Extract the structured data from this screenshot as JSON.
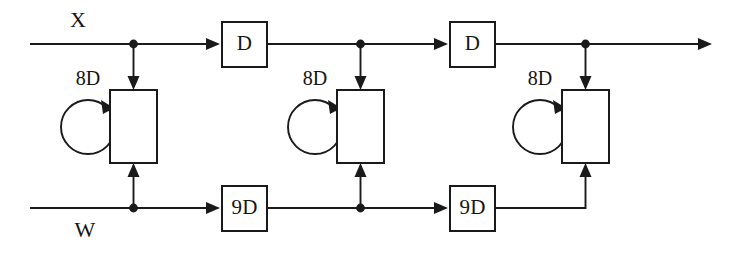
{
  "diagram": {
    "type": "signal-flow-diagram",
    "canvas": {
      "width": 730,
      "height": 254
    },
    "colors": {
      "line": "#1a1a1a",
      "background": "#ffffff",
      "text": "#141414"
    },
    "io_labels": [
      {
        "id": "input-x",
        "text": "X",
        "x": 78,
        "y": 22,
        "position": "above-top-line"
      },
      {
        "id": "input-w",
        "text": "W",
        "x": 85,
        "y": 232,
        "position": "below-bottom-line"
      }
    ],
    "top_line": {
      "y": 44,
      "x_start": 30,
      "x_end": 703,
      "terminal_arrow": true,
      "junctions": [
        {
          "id": "tap-1",
          "x": 131
        },
        {
          "id": "tap-2",
          "x": 358
        },
        {
          "id": "tap-3",
          "x": 585
        }
      ],
      "delay_boxes": [
        {
          "id": "delay-d-1",
          "label": "D",
          "x": 222,
          "y": 22,
          "width": 45,
          "height": 45
        },
        {
          "id": "delay-d-2",
          "label": "D",
          "x": 450,
          "y": 22,
          "width": 45,
          "height": 45
        }
      ]
    },
    "bottom_line": {
      "y": 208,
      "x_start": 30,
      "x_end": 578,
      "junctions": [
        {
          "id": "wtap-1",
          "x": 131
        },
        {
          "id": "wtap-2",
          "x": 358
        }
      ],
      "delay_boxes": [
        {
          "id": "delay-9d-1",
          "label": "9D",
          "x": 222,
          "y": 186,
          "width": 45,
          "height": 45
        },
        {
          "id": "delay-9d-2",
          "label": "9D",
          "x": 450,
          "y": 186,
          "width": 45,
          "height": 45
        }
      ]
    },
    "stages": [
      {
        "id": "stage-1",
        "box": {
          "x": 110,
          "y": 90,
          "width": 47,
          "height": 73
        },
        "loop": {
          "label": "8D",
          "cx": 88,
          "cy": 127,
          "r": 27
        },
        "loop_label_pos": {
          "x": 88,
          "y": 80
        },
        "input_from_top": true,
        "input_from_bottom": true,
        "bottom_feed": "vertical"
      },
      {
        "id": "stage-2",
        "box": {
          "x": 337,
          "y": 90,
          "width": 47,
          "height": 73
        },
        "loop": {
          "label": "8D",
          "cx": 315,
          "cy": 127,
          "r": 27
        },
        "loop_label_pos": {
          "x": 315,
          "y": 80
        },
        "input_from_top": true,
        "input_from_bottom": true,
        "bottom_feed": "vertical"
      },
      {
        "id": "stage-3",
        "box": {
          "x": 562,
          "y": 90,
          "width": 47,
          "height": 73
        },
        "loop": {
          "label": "8D",
          "cx": 540,
          "cy": 127,
          "r": 27
        },
        "loop_label_pos": {
          "x": 540,
          "y": 80
        },
        "input_from_top": true,
        "input_from_bottom": true,
        "bottom_feed": "corner-right"
      }
    ]
  }
}
